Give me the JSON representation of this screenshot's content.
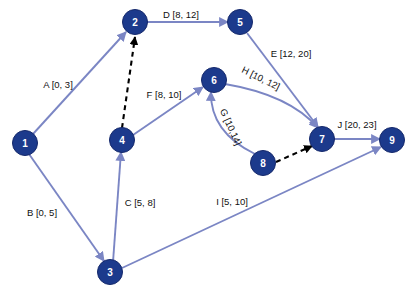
{
  "diagram": {
    "type": "activity-on-arrow-network",
    "colors": {
      "node_fill": "#1c3a8c",
      "node_text": "#ffffff",
      "edge": "#7b86c4",
      "dashed_edge": "#000000",
      "background": "#ffffff"
    },
    "nodes": [
      {
        "id": "1",
        "label": "1",
        "x": 25,
        "y": 143
      },
      {
        "id": "2",
        "label": "2",
        "x": 135,
        "y": 22
      },
      {
        "id": "3",
        "label": "3",
        "x": 110,
        "y": 272
      },
      {
        "id": "4",
        "label": "4",
        "x": 122,
        "y": 140
      },
      {
        "id": "5",
        "label": "5",
        "x": 240,
        "y": 22
      },
      {
        "id": "6",
        "label": "6",
        "x": 214,
        "y": 80
      },
      {
        "id": "7",
        "label": "7",
        "x": 322,
        "y": 139
      },
      {
        "id": "8",
        "label": "8",
        "x": 263,
        "y": 163
      },
      {
        "id": "9",
        "label": "9",
        "x": 392,
        "y": 140
      }
    ],
    "edges": [
      {
        "id": "A",
        "from": "1",
        "to": "2",
        "label": "A [0, 3]",
        "activity": "A",
        "early_start": 0,
        "late_finish": 3,
        "style": "solid",
        "label_x": 58,
        "label_y": 84,
        "rotate": 0
      },
      {
        "id": "B",
        "from": "1",
        "to": "3",
        "label": "B [0, 5]",
        "activity": "B",
        "early_start": 0,
        "late_finish": 5,
        "style": "solid",
        "label_x": 42,
        "label_y": 212,
        "rotate": 0
      },
      {
        "id": "C",
        "from": "3",
        "to": "4",
        "label": "C [5, 8]",
        "activity": "C",
        "early_start": 5,
        "late_finish": 8,
        "style": "solid",
        "label_x": 140,
        "label_y": 202,
        "rotate": 0
      },
      {
        "id": "D",
        "from": "2",
        "to": "5",
        "label": "D [8, 12]",
        "activity": "D",
        "early_start": 8,
        "late_finish": 12,
        "style": "solid",
        "label_x": 181,
        "label_y": 14,
        "rotate": 0
      },
      {
        "id": "E",
        "from": "5",
        "to": "7",
        "label": "E [12, 20]",
        "activity": "E",
        "early_start": 12,
        "late_finish": 20,
        "style": "solid",
        "label_x": 291,
        "label_y": 53,
        "rotate": 0
      },
      {
        "id": "F",
        "from": "4",
        "to": "6",
        "label": "F [8, 10]",
        "activity": "F",
        "early_start": 8,
        "late_finish": 10,
        "style": "solid",
        "label_x": 164,
        "label_y": 94,
        "rotate": 0
      },
      {
        "id": "G",
        "from": "8",
        "to": "6",
        "label": "G [10,14]",
        "activity": "G",
        "early_start": 10,
        "late_finish": 14,
        "style": "curve",
        "label_x": 231,
        "label_y": 127,
        "rotate": 66
      },
      {
        "id": "H",
        "from": "6",
        "to": "7",
        "label": "H [10, 12]",
        "activity": "H",
        "early_start": 10,
        "late_finish": 12,
        "style": "curve",
        "label_x": 261,
        "label_y": 78,
        "rotate": 26
      },
      {
        "id": "I",
        "from": "3",
        "to": "9",
        "label": "I [5, 10]",
        "activity": "I",
        "early_start": 5,
        "late_finish": 10,
        "style": "solid",
        "label_x": 232,
        "label_y": 201,
        "rotate": 0
      },
      {
        "id": "J",
        "from": "7",
        "to": "9",
        "label": "J [20, 23]",
        "activity": "J",
        "early_start": 20,
        "late_finish": 23,
        "style": "solid",
        "label_x": 357,
        "label_y": 124,
        "rotate": 0
      },
      {
        "id": "dummy-4-2",
        "from": "4",
        "to": "2",
        "label": "",
        "activity": "",
        "style": "dashed"
      },
      {
        "id": "dummy-8-7",
        "from": "8",
        "to": "7",
        "label": "",
        "activity": "",
        "style": "dashed"
      }
    ]
  }
}
